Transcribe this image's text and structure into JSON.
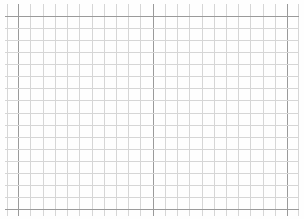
{
  "paper": {
    "kind": "graph-paper",
    "background": "#fefefe",
    "minor_line_color": "#d6d6d6",
    "major_line_color": "#9a9a9a",
    "vertical_lines_x": [
      7,
      18,
      30,
      43,
      55,
      67,
      79,
      92,
      104,
      116,
      128,
      140,
      153,
      165,
      177,
      189,
      202,
      214,
      226,
      238,
      250,
      263,
      275,
      287,
      298
    ],
    "major_vertical_lines_x": [
      18,
      153,
      287
    ],
    "horizontal_lines_y": [
      16,
      28,
      40,
      52,
      64,
      76,
      88,
      100,
      113,
      125,
      137,
      149,
      161,
      173,
      185,
      197,
      209
    ],
    "major_horizontal_lines_y": [
      16,
      209
    ]
  }
}
